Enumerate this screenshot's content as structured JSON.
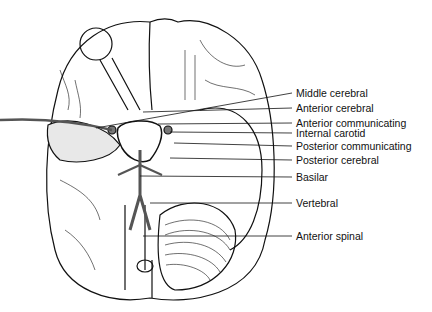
{
  "figure": {
    "labels": [
      {
        "text": "Middle cerebral",
        "y": 93,
        "target": [
          96,
          128
        ]
      },
      {
        "text": "Anterior cerebral",
        "y": 108,
        "target": [
          143,
          112
        ]
      },
      {
        "text": "Anterior communicating",
        "y": 123,
        "target": [
          158,
          124
        ]
      },
      {
        "text": "Internal carotid",
        "y": 133,
        "target": [
          170,
          132
        ]
      },
      {
        "text": "Posterior communicating",
        "y": 146,
        "target": [
          174,
          143
        ]
      },
      {
        "text": "Posterior cerebral",
        "y": 160,
        "target": [
          170,
          158
        ]
      },
      {
        "text": "Basilar",
        "y": 177,
        "target": [
          140,
          176
        ]
      },
      {
        "text": "Vertebral",
        "y": 203,
        "target": [
          150,
          203
        ]
      },
      {
        "text": "Anterior spinal",
        "y": 236,
        "target": [
          143,
          236
        ]
      }
    ]
  }
}
